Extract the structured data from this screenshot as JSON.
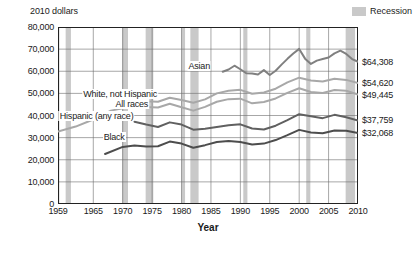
{
  "header": {
    "y_axis_note": "2010 dollars",
    "legend_label": "Recession",
    "legend_swatch_color": "#c9c9c9"
  },
  "axes": {
    "xlabel": "Year",
    "yticks": [
      "0",
      "10,000",
      "20,000",
      "30,000",
      "40,000",
      "50,000",
      "60,000",
      "70,000",
      "80,000"
    ],
    "ytick_values": [
      0,
      10000,
      20000,
      30000,
      40000,
      50000,
      60000,
      70000,
      80000
    ],
    "xticks": [
      "1959",
      "1965",
      "1970",
      "1975",
      "1980",
      "1985",
      "1990",
      "1995",
      "2000",
      "2005",
      "2010"
    ],
    "xtick_values": [
      1959,
      1965,
      1970,
      1975,
      1980,
      1985,
      1990,
      1995,
      2000,
      2005,
      2010
    ]
  },
  "series_labels": {
    "asian": "Asian",
    "white_not_hispanic": "White, not Hispanic",
    "all_races": "All races",
    "hispanic": "Hispanic (any race)",
    "black": "Black"
  },
  "end_labels": {
    "asian": "$64,308",
    "white_not_hispanic": "$54,620",
    "all_races": "$49,445",
    "hispanic": "$37,759",
    "black": "$32,068"
  },
  "chart_data": {
    "type": "line",
    "title": "",
    "xlabel": "Year",
    "ylabel": "2010 dollars",
    "xlim": [
      1959,
      2010
    ],
    "ylim": [
      0,
      80000
    ],
    "grid": true,
    "legend_position": "inline-annotations",
    "recession_bands": [
      {
        "start": 1960.3,
        "end": 1961.2
      },
      {
        "start": 1969.9,
        "end": 1970.9
      },
      {
        "start": 1973.9,
        "end": 1975.2
      },
      {
        "start": 1980.0,
        "end": 1980.6
      },
      {
        "start": 1981.5,
        "end": 1982.9
      },
      {
        "start": 1990.5,
        "end": 1991.2
      },
      {
        "start": 2001.2,
        "end": 2001.9
      },
      {
        "start": 2007.9,
        "end": 2009.5
      }
    ],
    "series": [
      {
        "name": "Asian",
        "color": "#808080",
        "width": 2.0,
        "x": [
          1987,
          1988,
          1989,
          1990,
          1991,
          1992,
          1993,
          1994,
          1995,
          1996,
          1997,
          1998,
          1999,
          2000,
          2001,
          2002,
          2003,
          2004,
          2005,
          2006,
          2007,
          2008,
          2009,
          2010
        ],
        "values": [
          59800,
          60800,
          62500,
          60900,
          59100,
          59000,
          58500,
          60500,
          58300,
          60200,
          63000,
          65600,
          68000,
          70100,
          65700,
          63300,
          64800,
          65500,
          66200,
          68100,
          69300,
          67800,
          65500,
          64308
        ]
      },
      {
        "name": "White, not Hispanic",
        "color": "#a8a8a8",
        "width": 2.0,
        "x": [
          1972,
          1974,
          1976,
          1978,
          1980,
          1982,
          1984,
          1986,
          1988,
          1990,
          1992,
          1994,
          1996,
          1998,
          2000,
          2002,
          2004,
          2006,
          2008,
          2010
        ],
        "values": [
          46800,
          46400,
          46200,
          48000,
          47000,
          45800,
          47300,
          50000,
          51200,
          51600,
          49800,
          50400,
          52100,
          55000,
          57100,
          55800,
          55400,
          56600,
          56100,
          54620
        ]
      },
      {
        "name": "All races",
        "color": "#a8a8a8",
        "width": 2.0,
        "x": [
          1959,
          1962,
          1965,
          1968,
          1970,
          1972,
          1974,
          1976,
          1978,
          1980,
          1982,
          1984,
          1986,
          1988,
          1990,
          1992,
          1994,
          1996,
          1998,
          2000,
          2002,
          2004,
          2006,
          2008,
          2010
        ],
        "values": [
          32800,
          35000,
          38200,
          42200,
          43300,
          44900,
          43800,
          43600,
          45300,
          43700,
          42200,
          43900,
          46200,
          47400,
          47600,
          45500,
          46100,
          47700,
          50200,
          52300,
          50600,
          50200,
          51500,
          51200,
          49445
        ]
      },
      {
        "name": "Hispanic (any race)",
        "color": "#606060",
        "width": 2.0,
        "x": [
          1972,
          1974,
          1976,
          1978,
          1980,
          1982,
          1984,
          1986,
          1988,
          1990,
          1992,
          1994,
          1996,
          1998,
          2000,
          2002,
          2004,
          2006,
          2008,
          2010
        ],
        "values": [
          37200,
          35900,
          34800,
          36900,
          35900,
          33600,
          34000,
          34800,
          35600,
          36000,
          34100,
          33700,
          35400,
          37900,
          40600,
          39700,
          38800,
          40300,
          39200,
          37759
        ]
      },
      {
        "name": "Black",
        "color": "#4d4d4d",
        "width": 2.0,
        "x": [
          1967,
          1970,
          1972,
          1974,
          1976,
          1978,
          1980,
          1982,
          1984,
          1986,
          1988,
          1990,
          1992,
          1994,
          1996,
          1998,
          2000,
          2002,
          2004,
          2006,
          2008,
          2010
        ],
        "values": [
          22600,
          25800,
          26400,
          26000,
          26100,
          28200,
          27300,
          25400,
          26600,
          28000,
          28500,
          28000,
          26900,
          27300,
          28900,
          31100,
          33500,
          32300,
          32000,
          33200,
          33100,
          32068
        ]
      }
    ]
  }
}
